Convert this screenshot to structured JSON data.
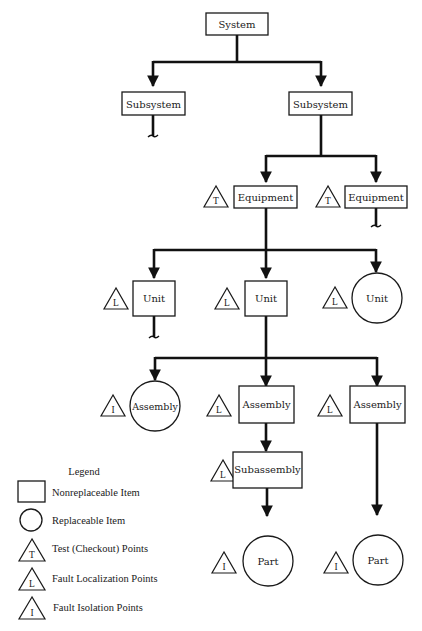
{
  "diagram": {
    "type": "maintenance-hierarchy",
    "nodes": {
      "system": {
        "label": "System",
        "shape": "rectangle"
      },
      "subsystem_left": {
        "label": "Subsystem",
        "shape": "rectangle",
        "continues": true
      },
      "subsystem_right": {
        "label": "Subsystem",
        "shape": "rectangle"
      },
      "equipment_left": {
        "label": "Equipment",
        "shape": "rectangle",
        "point": "T"
      },
      "equipment_right": {
        "label": "Equipment",
        "shape": "rectangle",
        "point": "T",
        "continues": true
      },
      "unit_left": {
        "label": "Unit",
        "shape": "rectangle",
        "point": "L",
        "continues": true
      },
      "unit_mid": {
        "label": "Unit",
        "shape": "rectangle",
        "point": "L"
      },
      "unit_right": {
        "label": "Unit",
        "shape": "circle",
        "point": "L"
      },
      "assembly_left": {
        "label": "Assembly",
        "shape": "circle",
        "point": "I"
      },
      "assembly_mid": {
        "label": "Assembly",
        "shape": "rectangle",
        "point": "L"
      },
      "assembly_right": {
        "label": "Assembly",
        "shape": "rectangle",
        "point": "L"
      },
      "subassembly": {
        "label": "Subassembly",
        "shape": "rectangle",
        "point": "L"
      },
      "part_mid": {
        "label": "Part",
        "shape": "circle",
        "point": "I"
      },
      "part_right": {
        "label": "Part",
        "shape": "circle",
        "point": "I"
      }
    },
    "edges": [
      [
        "system",
        "subsystem_left"
      ],
      [
        "system",
        "subsystem_right"
      ],
      [
        "subsystem_right",
        "equipment_left"
      ],
      [
        "subsystem_right",
        "equipment_right"
      ],
      [
        "equipment_left",
        "unit_left"
      ],
      [
        "equipment_left",
        "unit_mid"
      ],
      [
        "equipment_left",
        "unit_right"
      ],
      [
        "unit_mid",
        "assembly_left"
      ],
      [
        "unit_mid",
        "assembly_mid"
      ],
      [
        "unit_mid",
        "assembly_right"
      ],
      [
        "assembly_mid",
        "subassembly"
      ],
      [
        "subassembly",
        "part_mid"
      ],
      [
        "assembly_right",
        "part_right"
      ]
    ]
  },
  "legend": {
    "title": "Legend",
    "items": [
      {
        "symbol": "rectangle",
        "label": "Nonreplaceable Item"
      },
      {
        "symbol": "circle",
        "label": "Replaceable Item"
      },
      {
        "symbol": "triangle",
        "letter": "T",
        "label": "Test (Checkout) Points"
      },
      {
        "symbol": "triangle",
        "letter": "L",
        "label": "Fault Localization Points"
      },
      {
        "symbol": "triangle",
        "letter": "I",
        "label": "Fault Isolation Points"
      }
    ]
  }
}
